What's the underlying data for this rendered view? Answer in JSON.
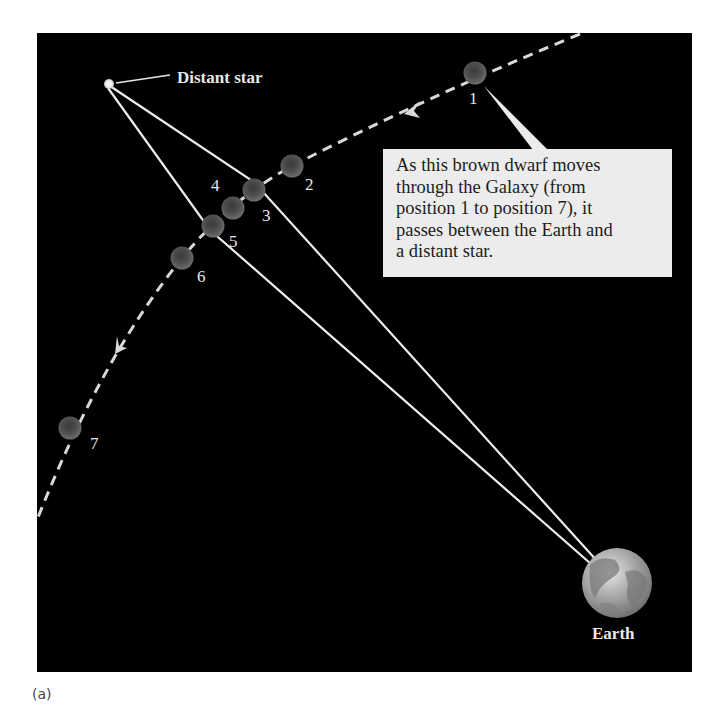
{
  "figure": {
    "caption": "(a)",
    "colors": {
      "background": "#000000",
      "lines": "#e6e6e6",
      "callout_fill": "#ececec",
      "callout_text": "#1c1c1c",
      "dwarf": "#555555",
      "earth": "#9a9a9a"
    },
    "distant_star": {
      "label": "Distant star",
      "x": 109,
      "y": 84
    },
    "earth": {
      "label": "Earth",
      "x": 617,
      "y": 583,
      "r": 35
    },
    "brown_dwarf_positions": [
      {
        "n": "1",
        "x": 475,
        "y": 73
      },
      {
        "n": "2",
        "x": 292,
        "y": 166
      },
      {
        "n": "3",
        "x": 254,
        "y": 190
      },
      {
        "n": "4",
        "x": 233,
        "y": 208
      },
      {
        "n": "5",
        "x": 213,
        "y": 226
      },
      {
        "n": "6",
        "x": 182,
        "y": 258
      },
      {
        "n": "7",
        "x": 70,
        "y": 428
      }
    ],
    "callout": {
      "lines": [
        "As this brown dwarf moves",
        "through the Galaxy (from",
        "position 1 to position 7), it",
        "passes between the Earth and",
        "a distant star."
      ]
    },
    "path_direction": "from position 1 to position 7"
  }
}
